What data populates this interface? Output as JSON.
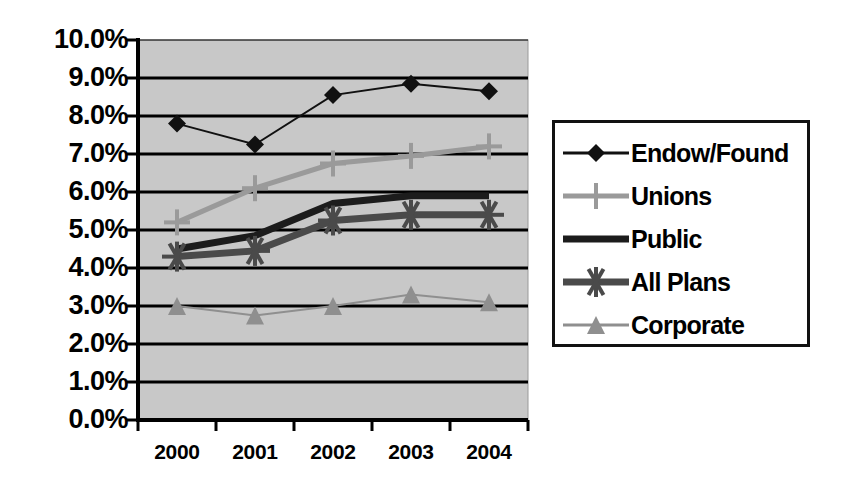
{
  "chart_data": {
    "type": "line",
    "title": "",
    "xlabel": "",
    "ylabel": "",
    "categories": [
      "2000",
      "2001",
      "2002",
      "2003",
      "2004"
    ],
    "ylim": [
      0,
      10
    ],
    "y_ticks": [
      "0.0%",
      "1.0%",
      "2.0%",
      "3.0%",
      "4.0%",
      "5.0%",
      "6.0%",
      "7.0%",
      "8.0%",
      "9.0%",
      "10.0%"
    ],
    "y_tick_values": [
      0,
      1,
      2,
      3,
      4,
      5,
      6,
      7,
      8,
      9,
      10
    ],
    "grid": true,
    "legend_position": "right",
    "plot_background": "#c8c8c8",
    "series": [
      {
        "name": "Endow/Found",
        "values": [
          7.8,
          7.25,
          8.55,
          8.85,
          8.65
        ],
        "color": "#111111",
        "marker": "diamond",
        "line_width": 2
      },
      {
        "name": "Unions",
        "values": [
          5.2,
          6.1,
          6.75,
          6.95,
          7.2
        ],
        "color": "#9a9a9a",
        "marker": "plus",
        "line_width": 5
      },
      {
        "name": "Public",
        "values": [
          4.5,
          4.85,
          5.7,
          5.9,
          5.9
        ],
        "color": "#1c1c1c",
        "marker": "none",
        "line_width": 7
      },
      {
        "name": "All Plans",
        "values": [
          4.3,
          4.45,
          5.25,
          5.4,
          5.4
        ],
        "color": "#4a4a4a",
        "marker": "asterisk",
        "line_width": 7
      },
      {
        "name": "Corporate",
        "values": [
          3.0,
          2.75,
          3.0,
          3.3,
          3.1
        ],
        "color": "#8f8f8f",
        "marker": "triangle",
        "line_width": 2
      }
    ]
  },
  "legend": {
    "items": [
      {
        "label": "Endow/Found"
      },
      {
        "label": "Unions"
      },
      {
        "label": "Public"
      },
      {
        "label": "All Plans"
      },
      {
        "label": "Corporate"
      }
    ]
  },
  "colors": {
    "plot_area": "#c8c8c8",
    "gridline": "#000000",
    "axis": "#000000",
    "text": "#000000",
    "legend_border": "#111111",
    "legend_background": "#ffffff"
  }
}
